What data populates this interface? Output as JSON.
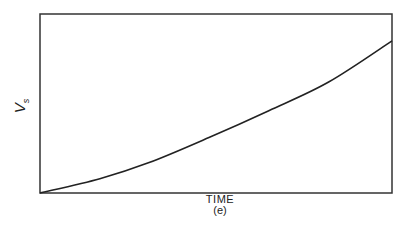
{
  "chart_data": {
    "type": "line",
    "title": "",
    "xlabel": "TIME",
    "ylabel": "V_s",
    "ylabel_main": "V",
    "ylabel_sub": "s",
    "caption": "(e)",
    "grid": false,
    "legend": null,
    "x": [
      0,
      0.17,
      0.31,
      0.48,
      0.65,
      0.82,
      1.0
    ],
    "series": [
      {
        "name": "V_s",
        "values": [
          0,
          0.08,
          0.17,
          0.31,
          0.46,
          0.62,
          0.85
        ]
      }
    ],
    "xlim": [
      0,
      1
    ],
    "ylim": [
      0,
      1
    ],
    "note": "Qualitative plot; no numeric tick labels shown. Curve rises monotonically and is concave up."
  },
  "colors": {
    "line": "#222222",
    "background": "#ffffff"
  }
}
